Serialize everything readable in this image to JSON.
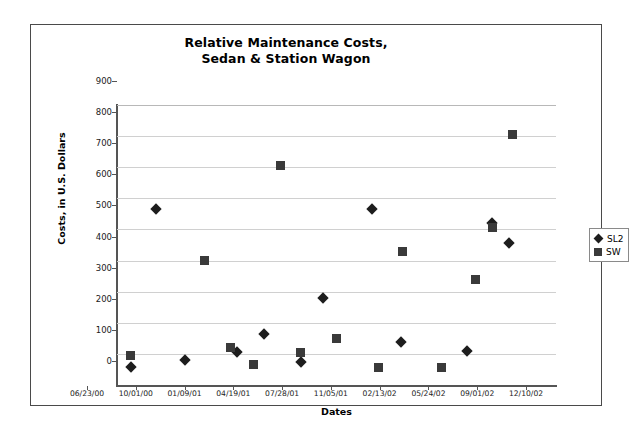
{
  "chart_data": {
    "type": "scatter",
    "title": "Relative Maintenance Costs,",
    "title_line2": "Sedan & Station Wagon",
    "xlabel": "Dates",
    "ylabel": "Costs, in U.S. Dollars",
    "ylim": [
      0,
      900
    ],
    "y_ticks": [
      0,
      100,
      200,
      300,
      400,
      500,
      600,
      700,
      800,
      900
    ],
    "x_ticks": [
      "06/23/00",
      "10/01/00",
      "01/09/01",
      "04/19/01",
      "07/28/01",
      "11/05/01",
      "02/13/02",
      "05/24/02",
      "09/01/02",
      "12/10/02"
    ],
    "grid": true,
    "legend_position": "right",
    "series": [
      {
        "name": "SL2",
        "marker": "diamond",
        "color": "#1d1d1d",
        "points": [
          {
            "x": "07/21/00",
            "y": 58
          },
          {
            "x": "09/11/00",
            "y": 565
          },
          {
            "x": "11/10/00",
            "y": 80
          },
          {
            "x": "02/25/01",
            "y": 105
          },
          {
            "x": "04/20/01",
            "y": 165
          },
          {
            "x": "07/06/01",
            "y": 75
          },
          {
            "x": "08/20/01",
            "y": 280
          },
          {
            "x": "11/27/01",
            "y": 565
          },
          {
            "x": "01/26/02",
            "y": 138
          },
          {
            "x": "06/10/02",
            "y": 110
          },
          {
            "x": "08/01/02",
            "y": 520
          },
          {
            "x": "09/05/02",
            "y": 455
          }
        ]
      },
      {
        "name": "SW",
        "marker": "square",
        "color": "#3a3a3a",
        "points": [
          {
            "x": "07/21/00",
            "y": 95
          },
          {
            "x": "12/20/00",
            "y": 400
          },
          {
            "x": "02/10/01",
            "y": 120
          },
          {
            "x": "03/30/01",
            "y": 67
          },
          {
            "x": "05/25/01",
            "y": 705
          },
          {
            "x": "07/04/01",
            "y": 105
          },
          {
            "x": "09/15/01",
            "y": 148
          },
          {
            "x": "12/12/01",
            "y": 55
          },
          {
            "x": "01/30/02",
            "y": 428
          },
          {
            "x": "04/20/02",
            "y": 55
          },
          {
            "x": "06/28/02",
            "y": 340
          },
          {
            "x": "08/01/02",
            "y": 505
          },
          {
            "x": "09/12/02",
            "y": 805
          }
        ]
      }
    ]
  },
  "legend": {
    "entries": [
      {
        "label": "SL2",
        "marker": "diamond"
      },
      {
        "label": "SW",
        "marker": "square"
      }
    ]
  }
}
